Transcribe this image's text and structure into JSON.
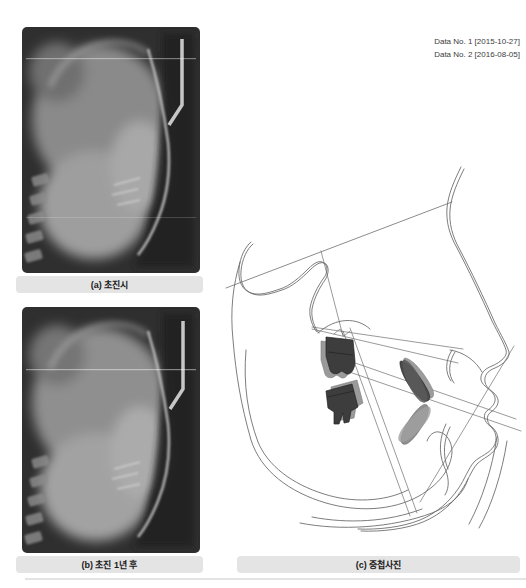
{
  "header": {
    "data_entries": [
      "Data No. 1 [2015-10-27]",
      "Data No. 2 [2016-08-05]"
    ]
  },
  "figures": {
    "xray_initial": {
      "caption": "(a) 초진시"
    },
    "xray_one_year": {
      "caption": "(b) 초진 1년 후"
    },
    "tracing_superimposition": {
      "caption": "(c) 중첩사진"
    }
  },
  "colors": {
    "page_background": "#ffffff",
    "caption_bar_background": "#e4e4e4",
    "caption_text": "#1a1a1a",
    "header_text": "#3c3c3c",
    "xray_background": "#2f2f2f",
    "tracing_stroke": "#6e6e6e",
    "tooth_dark_fill": "#3d3d3d",
    "tooth_gray_fill": "#9a9a9a",
    "divider": "#e3e3e3"
  }
}
